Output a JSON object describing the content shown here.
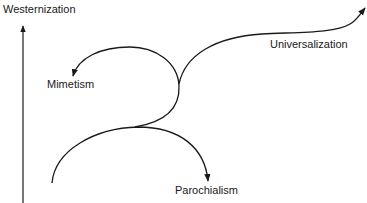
{
  "diagram": {
    "axis_label": "Westernization",
    "labels": {
      "universalization": "Universalization",
      "mimetism": "Mimetism",
      "parochialism": "Parochialism"
    },
    "colors": {
      "stroke": "#1a1a1a",
      "background": "#ffffff"
    }
  }
}
